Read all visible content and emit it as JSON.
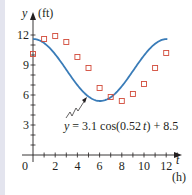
{
  "chart_data": {
    "type": "scatter",
    "title": "",
    "xlabel": "t",
    "xunit": "(h)",
    "ylabel": "y",
    "yunit": "(ft)",
    "xlim": [
      0,
      13
    ],
    "ylim": [
      0,
      13
    ],
    "x_ticks": [
      0,
      2,
      4,
      6,
      8,
      10,
      12
    ],
    "y_ticks": [
      3,
      6,
      9,
      12
    ],
    "grid": false,
    "series": [
      {
        "name": "data",
        "kind": "scatter",
        "marker": "hollow-square",
        "color": "#d24b3a",
        "x": [
          0,
          1,
          2,
          3,
          4,
          5,
          6,
          7,
          8,
          9,
          10,
          11,
          12
        ],
        "y": [
          10.1,
          11.6,
          11.9,
          11.3,
          9.8,
          8.7,
          6.7,
          5.8,
          5.4,
          6.1,
          7.1,
          8.7,
          10.2
        ]
      },
      {
        "name": "model",
        "kind": "line",
        "color": "#3a7cb8",
        "formula": "y = 3.1 cos(0.52 t) + 8.5",
        "amplitude": 3.1,
        "frequency": 0.52,
        "offset": 8.5,
        "t_range": [
          0,
          12.1
        ]
      }
    ],
    "annotations": [
      {
        "text": "y = 3.1 cos(0.52 t) + 8.5",
        "points_to": "model curve near minimum"
      }
    ]
  },
  "axes": {
    "y_label": "y",
    "y_unit": "(ft)",
    "x_label": "t",
    "x_unit": "(h)",
    "origin_label": "0",
    "x_tick_labels": [
      "2",
      "4",
      "6",
      "8",
      "10",
      "12"
    ],
    "y_tick_labels": [
      "12",
      "9",
      "6",
      "3"
    ]
  },
  "equation": {
    "lhs": "y",
    "eq": "=",
    "rhs_a": "3.1 cos(0.52",
    "var": "t",
    "rhs_b": ") + 8.5"
  }
}
